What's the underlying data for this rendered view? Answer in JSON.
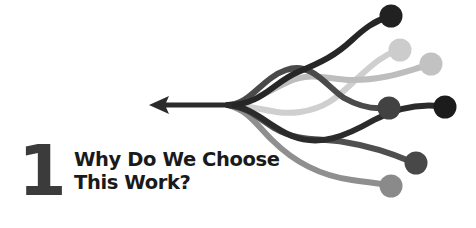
{
  "page": {
    "kind": "book-chapter-opener",
    "background_color": "#ffffff"
  },
  "chapter": {
    "number": "1",
    "number_color": "#3b3b3b",
    "title_line_1": "Why Do We Choose",
    "title_line_2": "This Work?",
    "title_color": "#1a1a1a"
  },
  "graphic": {
    "name": "converging-paths-arrow",
    "description": "Six curved paths of varying gray tones, each ending in a filled circle on the right, converging leftward into a single arrow pointing left",
    "arrow": {
      "color": "#2b2b2b",
      "tip_x": 150,
      "tip_y": 105,
      "shaft_end_x": 232,
      "stroke_width": 5
    },
    "convergence_point": {
      "x": 228,
      "y": 105
    },
    "paths": [
      {
        "id": "path-1",
        "label": "darkest-upper",
        "color": "#262626",
        "stroke_width": 6,
        "d": "M 228 105 C 262 105 272 83 298 72 C 322 62 336 55 352 40 C 364 29 374 21 388 17",
        "dot": {
          "cx": 391,
          "cy": 16,
          "r": 11.5,
          "color": "#212121"
        }
      },
      {
        "id": "path-2",
        "label": "lightest-upper",
        "color": "#cfcfcf",
        "stroke_width": 6,
        "d": "M 228 105 C 258 105 274 116 300 112 C 330 108 342 92 360 76 C 374 63 384 55 396 51",
        "dot": {
          "cx": 400,
          "cy": 50,
          "r": 11.5,
          "color": "#cccccc"
        }
      },
      {
        "id": "path-3",
        "label": "light-upper-right",
        "color": "#bdbdbd",
        "stroke_width": 6,
        "d": "M 228 105 C 252 103 266 92 288 82 C 312 71 330 80 352 80 C 384 80 404 72 425 66",
        "dot": {
          "cx": 431,
          "cy": 64,
          "r": 11.5,
          "color": "#c2c2c2"
        }
      },
      {
        "id": "path-4",
        "label": "mid-dark-center",
        "color": "#4a4a4a",
        "stroke_width": 6,
        "d": "M 228 105 C 250 105 262 78 286 70 C 312 61 326 86 344 98 C 360 107 372 109 384 108",
        "dot": {
          "cx": 389,
          "cy": 108,
          "r": 11.5,
          "color": "#424242"
        }
      },
      {
        "id": "path-5",
        "label": "dark-lower-right",
        "color": "#2b2b2b",
        "stroke_width": 6,
        "d": "M 228 105 C 254 107 268 126 292 136 C 320 147 346 136 374 120 C 396 108 420 104 440 106",
        "dot": {
          "cx": 445,
          "cy": 107,
          "r": 11.5,
          "color": "#1c1c1c"
        }
      },
      {
        "id": "path-6",
        "label": "mid-dark-lower",
        "color": "#4f4f4f",
        "stroke_width": 6,
        "d": "M 228 105 C 250 108 258 118 274 128 C 298 142 318 138 344 142 C 376 147 398 156 412 162",
        "dot": {
          "cx": 416,
          "cy": 163,
          "r": 11.5,
          "color": "#484848"
        }
      },
      {
        "id": "path-7",
        "label": "mid-gray-bottom",
        "color": "#8f8f8f",
        "stroke_width": 6,
        "d": "M 228 105 C 248 110 256 124 272 140 C 296 164 322 176 352 180 C 368 182 380 184 388 185",
        "dot": {
          "cx": 391,
          "cy": 186,
          "r": 11.5,
          "color": "#8a8a8a"
        }
      }
    ]
  }
}
